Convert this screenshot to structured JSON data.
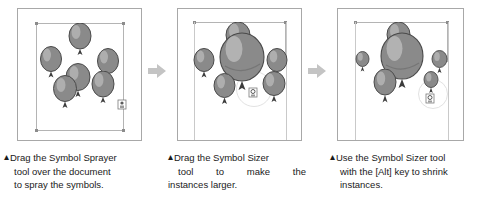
{
  "figure": {
    "type": "illustration-tutorial-strip",
    "panel_count": 3,
    "separator_icon": "right-arrow-icon",
    "panels": [
      {
        "id": "panel-1",
        "name": "symbol-sprayer-result",
        "symbol_count": 6,
        "symbol_kind": "balloon",
        "description": "Six evenly scattered balloon symbol instances inside the selection bounds"
      },
      {
        "id": "panel-2",
        "name": "symbol-sizer-enlarged",
        "symbol_count": 6,
        "symbol_kind": "balloon",
        "description": "Center balloon instances enlarged with the Symbol Sizer tool"
      },
      {
        "id": "panel-3",
        "name": "symbol-sizer-shrunk",
        "symbol_count": 6,
        "symbol_kind": "balloon",
        "description": "Outer balloon instances shrunk using the Symbol Sizer tool with the Alt key"
      }
    ]
  },
  "captions": [
    {
      "marker": "▴",
      "lines": [
        "Drag the Symbol Sprayer",
        "tool over the document",
        "to spray the symbols."
      ],
      "full_text": "Drag the Symbol Sprayer tool over the document to spray the symbols."
    },
    {
      "marker": "▴",
      "lines": [
        "Drag the Symbol Sizer",
        "tool to make the",
        "instances larger."
      ],
      "full_text": "Drag the Symbol Sizer tool to make the instances larger."
    },
    {
      "marker": "▴",
      "lines": [
        "Use the Symbol Sizer tool",
        "with the [Alt] key to shrink",
        "instances."
      ],
      "full_text": "Use the Symbol Sizer tool with the [Alt] key to shrink instances."
    }
  ],
  "colors": {
    "background": "#ffffff",
    "panel_border": "#a8a8a8",
    "selection_border": "#b4b4b4",
    "handle": "#8c8c8c",
    "balloon_fill": "#8a8a8a",
    "balloon_shade": "#6e6e6e",
    "balloon_highlight": "#b9b9b9",
    "balloon_outline": "#4a4a4a",
    "arrow": "#c0c0c0",
    "caption_text": "#1a1a1a",
    "marker": "#9a9a9a"
  },
  "icons": {
    "arrow": "right-arrow-icon",
    "caption_marker": "triangle-up-icon",
    "sprayer_cursor": "symbol-sprayer-cursor-icon",
    "sizer_cursor": "symbol-sizer-cursor-icon"
  }
}
